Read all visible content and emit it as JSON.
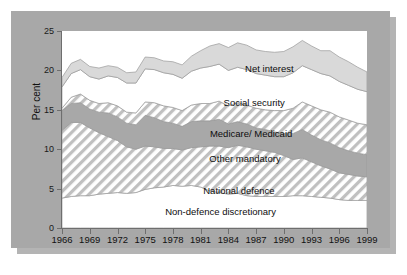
{
  "figure": {
    "panel_color": "#a8a8a8",
    "shadow_color": "#b4b4b4",
    "plot_background": "#ffffff"
  },
  "axes": {
    "y_title": "Per cent",
    "y_ticks": [
      "0",
      "5",
      "10",
      "15",
      "20",
      "25"
    ],
    "x_ticks": [
      "1966",
      "1969",
      "1972",
      "1975",
      "1978",
      "1981",
      "1984",
      "1987",
      "1990",
      "1993",
      "1996",
      "1999"
    ]
  },
  "series_labels": [
    {
      "name": "net-interest",
      "text": "Net interest",
      "x_pct": 68.0,
      "y_pct": 19.0
    },
    {
      "name": "social-security",
      "text": "Social security",
      "x_pct": 63.0,
      "y_pct": 36.0
    },
    {
      "name": "medicare-medicaid",
      "text": "Medicare/ Medicaid",
      "x_pct": 62.0,
      "y_pct": 52.0
    },
    {
      "name": "other-mandatory",
      "text": "Other mandatory",
      "x_pct": 60.0,
      "y_pct": 64.5
    },
    {
      "name": "national-defence",
      "text": "National defence",
      "x_pct": 58.0,
      "y_pct": 80.5
    },
    {
      "name": "non-defence-discretionary",
      "text": "Non-defence discretionary",
      "x_pct": 52.0,
      "y_pct": 91.5
    }
  ],
  "chart_data": {
    "type": "area",
    "title": "",
    "subtitle": "",
    "xlabel": "",
    "ylabel": "Per cent",
    "xlim": [
      1966,
      1999
    ],
    "ylim": [
      0,
      25
    ],
    "grid": false,
    "legend": "inline-labels",
    "stacked": true,
    "stack_order_bottom_to_top": [
      "Non-defence discretionary",
      "National defence",
      "Other mandatory",
      "Medicare/ Medicaid",
      "Social security",
      "Net interest"
    ],
    "x": [
      1966,
      1967,
      1968,
      1969,
      1970,
      1971,
      1972,
      1973,
      1974,
      1975,
      1976,
      1977,
      1978,
      1979,
      1980,
      1981,
      1982,
      1983,
      1984,
      1985,
      1986,
      1987,
      1988,
      1989,
      1990,
      1991,
      1992,
      1993,
      1994,
      1995,
      1996,
      1997,
      1998,
      1999
    ],
    "series": [
      {
        "name": "Non-defence discretionary",
        "fill": "#ffffff",
        "pattern": "solid",
        "values": [
          3.8,
          4.0,
          4.1,
          4.1,
          4.3,
          4.4,
          4.5,
          4.4,
          4.5,
          4.9,
          5.1,
          5.2,
          5.4,
          5.3,
          5.4,
          5.2,
          4.7,
          4.5,
          4.3,
          4.4,
          4.1,
          4.0,
          4.0,
          4.0,
          4.0,
          4.1,
          4.1,
          4.0,
          3.9,
          3.8,
          3.6,
          3.5,
          3.5,
          3.5
        ]
      },
      {
        "name": "National defence",
        "fill": "#ffffff",
        "pattern": "diagonal-hatch",
        "values": [
          8.6,
          9.4,
          9.3,
          8.6,
          7.8,
          7.2,
          6.6,
          5.9,
          5.5,
          5.5,
          5.2,
          4.9,
          4.7,
          4.6,
          4.8,
          5.1,
          5.7,
          5.9,
          5.9,
          6.1,
          6.2,
          6.0,
          5.8,
          5.6,
          5.2,
          4.6,
          4.8,
          4.4,
          4.0,
          3.7,
          3.4,
          3.3,
          3.1,
          3.0
        ]
      },
      {
        "name": "Other mandatory",
        "fill": "#a8a8a8",
        "pattern": "solid",
        "values": [
          2.5,
          2.4,
          2.5,
          2.4,
          2.6,
          3.0,
          3.0,
          3.0,
          3.1,
          3.9,
          3.7,
          3.4,
          3.2,
          3.0,
          3.3,
          3.3,
          3.2,
          3.4,
          3.0,
          3.0,
          2.9,
          2.7,
          2.7,
          2.6,
          2.8,
          3.3,
          3.6,
          3.4,
          3.3,
          3.3,
          3.2,
          3.0,
          2.9,
          2.8
        ]
      },
      {
        "name": "Medicare/ Medicaid",
        "fill": "#ffffff",
        "pattern": "diagonal-hatch",
        "values": [
          0.3,
          0.8,
          1.1,
          1.1,
          1.1,
          1.3,
          1.4,
          1.4,
          1.5,
          1.7,
          1.9,
          2.0,
          2.0,
          2.0,
          2.1,
          2.2,
          2.2,
          2.3,
          2.3,
          2.4,
          2.4,
          2.5,
          2.5,
          2.7,
          2.9,
          3.2,
          3.5,
          3.7,
          3.8,
          3.9,
          3.9,
          3.9,
          3.8,
          3.8
        ]
      },
      {
        "name": "Social security",
        "fill": "#ffffff",
        "pattern": "solid",
        "values": [
          2.7,
          3.0,
          3.1,
          3.0,
          3.1,
          3.4,
          3.6,
          3.7,
          3.8,
          4.2,
          4.2,
          4.2,
          4.2,
          4.1,
          4.3,
          4.5,
          4.7,
          4.7,
          4.5,
          4.5,
          4.5,
          4.4,
          4.4,
          4.3,
          4.3,
          4.5,
          4.6,
          4.6,
          4.6,
          4.6,
          4.5,
          4.4,
          4.3,
          4.2
        ]
      },
      {
        "name": "Net interest",
        "fill": "#d9d9d9",
        "pattern": "solid",
        "values": [
          1.2,
          1.3,
          1.3,
          1.3,
          1.4,
          1.3,
          1.3,
          1.3,
          1.4,
          1.5,
          1.5,
          1.5,
          1.6,
          1.7,
          1.9,
          2.2,
          2.6,
          2.6,
          2.9,
          3.1,
          3.1,
          3.0,
          3.0,
          3.1,
          3.2,
          3.3,
          3.2,
          3.0,
          2.9,
          3.2,
          3.1,
          3.0,
          2.8,
          2.5
        ]
      }
    ]
  }
}
